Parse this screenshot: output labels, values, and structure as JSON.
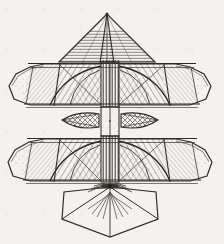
{
  "image": {
    "kind": "engraving",
    "subject": "flying-machine-aerial-apparatus",
    "orientation": "front-elevation-symmetric",
    "background_color": "#f4f2ef",
    "ink_color": "#3a3632",
    "line_color": "#2e2b27",
    "hatch_color": "#4a463f",
    "width": 224,
    "height": 244,
    "caption": "",
    "title": ""
  },
  "figure": {
    "name": "flying-machine",
    "parts": [
      {
        "id": "top-sail-cone",
        "label": "Top sail cone",
        "hatch": "horizontal"
      },
      {
        "id": "upper-wing-left",
        "label": "Upper left wing",
        "hatch": "diagonal"
      },
      {
        "id": "upper-wing-right",
        "label": "Upper right wing",
        "hatch": "diagonal"
      },
      {
        "id": "central-mast",
        "label": "Central ribbed mast",
        "hatch": "vertical"
      },
      {
        "id": "mid-fin-left",
        "label": "Mid left fin",
        "hatch": "crosshatch"
      },
      {
        "id": "mid-fin-right",
        "label": "Mid right fin",
        "hatch": "crosshatch"
      },
      {
        "id": "lower-wing-left",
        "label": "Lower left wing",
        "hatch": "diagonal"
      },
      {
        "id": "lower-wing-right",
        "label": "Lower right wing",
        "hatch": "diagonal"
      },
      {
        "id": "tail-fan-cone",
        "label": "Tail fan cone",
        "hatch": "radial"
      },
      {
        "id": "hub",
        "label": "Lower hub",
        "hatch": "radial"
      }
    ],
    "geometry": {
      "apex": {
        "x": 107,
        "y": 13
      },
      "wing_span_left": 8,
      "wing_span_right": 216,
      "upper_wing_top": 63,
      "upper_wing_bottom": 107,
      "lower_wing_top": 136,
      "lower_wing_bottom": 182,
      "mast_left": 101,
      "mast_right": 119,
      "tail_bottom": 238,
      "hub": {
        "x": 110,
        "y": 186
      }
    }
  }
}
